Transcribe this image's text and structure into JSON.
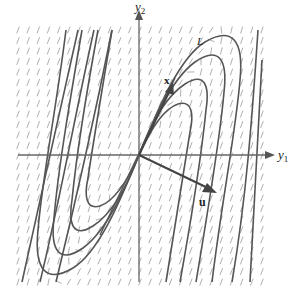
{
  "diagram": {
    "type": "phase-portrait",
    "axes": {
      "horizontal": {
        "label": "y",
        "subscript": "1"
      },
      "vertical": {
        "label": "y",
        "subscript": "2"
      }
    },
    "vectors": [
      {
        "name": "x",
        "label": "x",
        "description": "eigenvector direction, up-right through origin"
      },
      {
        "name": "u",
        "label": "u",
        "description": "generalized vector, down-right from origin"
      }
    ],
    "curve_label": "L",
    "colors": {
      "axis": "#555555",
      "trajectory": "#555555",
      "field": "#9a9a9a",
      "vector": "#444444",
      "background": "#ffffff"
    },
    "field": {
      "x0": 18,
      "y0": 30,
      "x1": 262,
      "y1": 282,
      "cols": 24,
      "rows": 24
    }
  }
}
